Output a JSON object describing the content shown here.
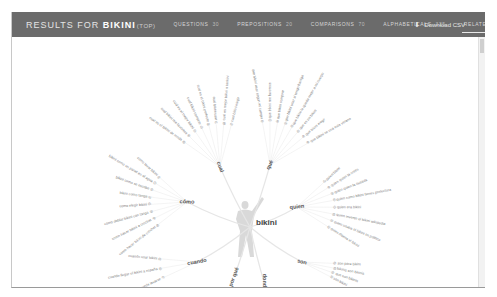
{
  "header": {
    "title_prefix": "RESULTS FOR",
    "keyword": "BIKINI",
    "qualifier": "(TOP)",
    "tabs": [
      {
        "label": "QUESTIONS",
        "count": "30",
        "active": false
      },
      {
        "label": "PREPOSITIONS",
        "count": "20",
        "active": false
      },
      {
        "label": "COMPARISONS",
        "count": "70",
        "active": false
      },
      {
        "label": "ALPHABETICALS",
        "count": "325",
        "active": false
      },
      {
        "label": "RELATED",
        "count": "8",
        "active": true
      }
    ],
    "download_label": "Download CSV"
  },
  "diagram": {
    "root": "bikini",
    "branches": [
      {
        "label": "cual",
        "leaves": [
          "cual es el bikini de moda",
          "cual bikini me favorece",
          "cual es el mejor bikini",
          "cual bikini comprar",
          "cual es el bikini perfecto",
          "cual bikini usar",
          "cual es mejor bikini o tankini",
          "cual bikini elegir"
        ]
      },
      {
        "label": "qué",
        "leaves": [
          "que bikini usar segun mi cuerpo",
          "que bikini me favorece",
          "que bikini comprar",
          "que bikini usar si tengo barriga",
          "que bikini le queda mejor a mi cuerpo",
          "que es un bikini",
          "que bikini elegir",
          "que bikini se usa este verano"
        ]
      },
      {
        "label": "cómo",
        "leaves": [
          "como hacer bikini de crochet",
          "como hacer bikini a crochet",
          "como doblar bikini con tanga",
          "como elegir bikini",
          "bikini como tanga",
          "bikini como se escribe",
          "bikini como un panel en el agua",
          "como lavar bikini"
        ]
      },
      {
        "label": "quien",
        "leaves": [
          "quien bikini",
          "quien quien la crees",
          "quien quien la oseada",
          "quien como bikini tienes protectora",
          "quien era bikini",
          "quien invento el bikini wikipedia",
          "quien usaba el bikini en politico",
          "quien disena el bikini"
        ]
      },
      {
        "label": "cuando",
        "leaves": [
          "cuando bikini puede lavarse",
          "cuando llegar el bikini a españa",
          "cuando usar bikini"
        ]
      },
      {
        "label": "por qué",
        "leaves": []
      },
      {
        "label": "donde",
        "leaves": []
      },
      {
        "label": "son",
        "leaves": [
          "son para bikini",
          "bikinis son bikinis",
          "que son bikinis",
          "son bikini"
        ]
      }
    ]
  },
  "colors": {
    "header_bg": "#6b6b6b",
    "link_line": "#e4e4e4",
    "leaf_text": "#7a7a7a"
  }
}
